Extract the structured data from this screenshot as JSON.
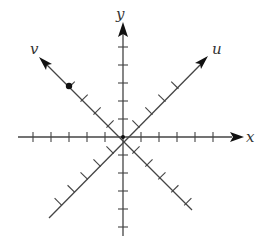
{
  "diagram": {
    "title": "",
    "origin": {
      "x": 123,
      "y": 137
    },
    "tick_spacing": 18,
    "axes": [
      {
        "name": "x",
        "label": "x",
        "type": "horizontal",
        "ticks_positive": 6,
        "ticks_negative": 5
      },
      {
        "name": "y",
        "label": "y",
        "type": "vertical",
        "ticks_positive": 5,
        "ticks_negative": 5
      },
      {
        "name": "u",
        "label": "u",
        "type": "diagonal-up-right",
        "ticks_positive": 4,
        "ticks_negative": 5
      },
      {
        "name": "v",
        "label": "v",
        "type": "diagonal-up-left",
        "ticks_positive": 4,
        "ticks_negative": 5
      }
    ],
    "point": {
      "axis": "v",
      "position_ticks": 2.5,
      "label": ""
    },
    "colors": {
      "line": "#444444",
      "arrow": "#111111",
      "label": "#333333",
      "background": "#ffffff"
    }
  }
}
